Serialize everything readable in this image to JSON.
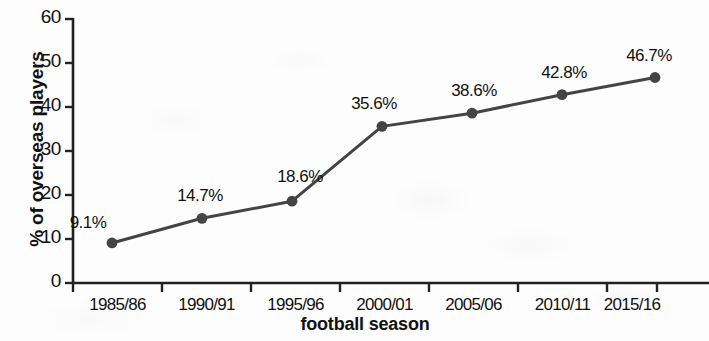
{
  "chart_data": {
    "type": "line",
    "title": "",
    "subtitle": "",
    "xlabel": "football season",
    "ylabel": "% of overseas players",
    "categories": [
      "1985/86",
      "1990/91",
      "1995/96",
      "2000/01",
      "2005/06",
      "2010/11",
      "2015/16"
    ],
    "values": [
      9.1,
      14.7,
      18.6,
      35.6,
      38.6,
      42.8,
      46.7
    ],
    "point_labels": [
      "9.1%",
      "14.7%",
      "18.6%",
      "35.6%",
      "38.6%",
      "42.8%",
      "46.7%"
    ],
    "ylim": [
      0,
      60
    ],
    "yticks": [
      0,
      10,
      20,
      30,
      40,
      50,
      60
    ],
    "ytick_labels": [
      "0",
      "10",
      "20",
      "30",
      "40",
      "50",
      "60"
    ],
    "grid": false,
    "legend": false,
    "legend_position": "none",
    "series": [
      {
        "name": "% of overseas players",
        "values": [
          9.1,
          14.7,
          18.6,
          35.6,
          38.6,
          42.8,
          46.7
        ],
        "color": "#444444",
        "marker": "circle",
        "line_width": 3
      }
    ]
  },
  "style": {
    "background": "#fdfdfd",
    "axis_color": "#222222",
    "text_color": "#111111",
    "series_color": "#444444"
  },
  "geometry": {
    "plot_left": 73,
    "plot_right": 657,
    "y_zero_px": 283,
    "y_top_px": 19,
    "point_x": [
      112,
      202,
      292,
      382,
      472,
      562,
      655
    ],
    "tick_x": [
      73,
      162,
      251,
      340,
      429,
      518,
      607,
      657
    ],
    "label_offsets": [
      {
        "dx": -24,
        "dy": -30
      },
      {
        "dx": -2,
        "dy": -32
      },
      {
        "dx": 8,
        "dy": -34
      },
      {
        "dx": -8,
        "dy": -32
      },
      {
        "dx": 2,
        "dy": -32
      },
      {
        "dx": 2,
        "dy": -32
      },
      {
        "dx": -6,
        "dy": -32
      }
    ]
  }
}
